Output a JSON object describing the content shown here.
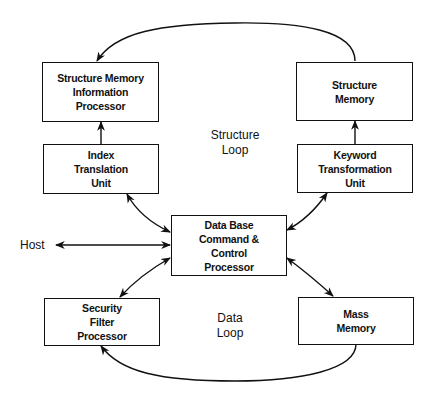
{
  "diagram": {
    "nodes": {
      "smip": {
        "lines": [
          "Structure Memory",
          "Information",
          "Processor"
        ]
      },
      "itu": {
        "lines": [
          "Index",
          "Translation",
          "Unit"
        ]
      },
      "sm": {
        "lines": [
          "Structure",
          "Memory"
        ]
      },
      "ktu": {
        "lines": [
          "Keyword",
          "Transformation",
          "Unit"
        ]
      },
      "dbccp": {
        "lines": [
          "Data Base",
          "Command &",
          "Control",
          "Processor"
        ]
      },
      "sfp": {
        "lines": [
          "Security",
          "Filter",
          "Processor"
        ]
      },
      "mm": {
        "lines": [
          "Mass",
          "Memory"
        ]
      }
    },
    "labels": {
      "host": "Host",
      "structure_loop": [
        "Structure",
        "Loop"
      ],
      "data_loop": [
        "Data",
        "Loop"
      ]
    },
    "edges": [
      {
        "from": "Structure Memory",
        "to": "Structure Memory Information Processor",
        "type": "curved-arrow"
      },
      {
        "from": "Index Translation Unit",
        "to": "Structure Memory Information Processor",
        "type": "arrow"
      },
      {
        "from": "Keyword Transformation Unit",
        "to": "Structure Memory",
        "type": "arrow"
      },
      {
        "from": "Index Translation Unit",
        "to": "Data Base Command & Control Processor",
        "type": "bidirectional"
      },
      {
        "from": "Keyword Transformation Unit",
        "to": "Data Base Command & Control Processor",
        "type": "bidirectional"
      },
      {
        "from": "Host",
        "to": "Data Base Command & Control Processor",
        "type": "bidirectional"
      },
      {
        "from": "Security Filter Processor",
        "to": "Data Base Command & Control Processor",
        "type": "bidirectional"
      },
      {
        "from": "Mass Memory",
        "to": "Data Base Command & Control Processor",
        "type": "bidirectional"
      },
      {
        "from": "Mass Memory",
        "to": "Security Filter Processor",
        "type": "curved-arrow"
      }
    ]
  }
}
